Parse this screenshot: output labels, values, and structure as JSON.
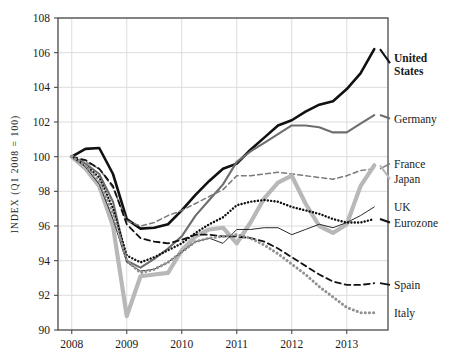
{
  "chart_data": {
    "type": "line",
    "title": "",
    "subtitle": "",
    "xlabel": "",
    "ylabel": "INDEX (Q1 2008 = 100)",
    "xlim": [
      2007.75,
      2013.75
    ],
    "ylim": [
      90,
      108
    ],
    "yticks": [
      90,
      92,
      94,
      96,
      98,
      100,
      102,
      104,
      106,
      108
    ],
    "xticks": [
      2008,
      2009,
      2010,
      2011,
      2012,
      2013
    ],
    "xtick_labels": [
      "2008",
      "2009",
      "2010",
      "2011",
      "2012",
      "2013"
    ],
    "ytick_labels": [
      "90",
      "92",
      "94",
      "96",
      "98",
      "100",
      "102",
      "104",
      "106",
      "108"
    ],
    "grid": true,
    "legend_position": "right-inline",
    "series": [
      {
        "name": "United States",
        "style": "solid",
        "color": "#111111",
        "width": 2.6,
        "bold_label": true,
        "label_y": 105.4,
        "x": [
          2008.0,
          2008.25,
          2008.5,
          2008.75,
          2009.0,
          2009.25,
          2009.5,
          2009.75,
          2010.0,
          2010.25,
          2010.5,
          2010.75,
          2011.0,
          2011.25,
          2011.5,
          2011.75,
          2012.0,
          2012.25,
          2012.5,
          2012.75,
          2013.0,
          2013.25,
          2013.5
        ],
        "values": [
          100.0,
          100.45,
          100.5,
          99.0,
          96.4,
          95.85,
          95.9,
          96.1,
          96.9,
          97.8,
          98.6,
          99.3,
          99.6,
          100.4,
          101.1,
          101.8,
          102.1,
          102.6,
          103.0,
          103.2,
          103.9,
          104.8,
          106.2
        ]
      },
      {
        "name": "Germany",
        "style": "solid",
        "color": "#6e6e6e",
        "width": 2.1,
        "bold_label": false,
        "label_y": 102.2,
        "x": [
          2008.0,
          2008.25,
          2008.5,
          2008.75,
          2009.0,
          2009.25,
          2009.5,
          2009.75,
          2010.0,
          2010.25,
          2010.5,
          2010.75,
          2011.0,
          2011.25,
          2011.5,
          2011.75,
          2012.0,
          2012.25,
          2012.5,
          2012.75,
          2013.0,
          2013.25,
          2013.5
        ],
        "values": [
          100.0,
          99.6,
          99.0,
          97.4,
          94.0,
          93.6,
          94.1,
          94.7,
          95.4,
          96.6,
          97.5,
          98.4,
          99.7,
          100.3,
          100.8,
          101.3,
          101.8,
          101.8,
          101.7,
          101.4,
          101.4,
          101.9,
          102.4
        ]
      },
      {
        "name": "France",
        "style": "dashed",
        "color": "#7a7a7a",
        "width": 1.5,
        "bold_label": false,
        "label_y": 99.6,
        "x": [
          2008.0,
          2008.25,
          2008.5,
          2008.75,
          2009.0,
          2009.25,
          2009.5,
          2009.75,
          2010.0,
          2010.25,
          2010.5,
          2010.75,
          2011.0,
          2011.25,
          2011.5,
          2011.75,
          2012.0,
          2012.25,
          2012.5,
          2012.75,
          2013.0,
          2013.25,
          2013.5
        ],
        "values": [
          100.0,
          99.7,
          99.3,
          98.2,
          96.3,
          96.0,
          96.2,
          96.6,
          96.9,
          97.3,
          97.7,
          98.1,
          98.9,
          98.9,
          99.0,
          99.1,
          99.0,
          98.9,
          98.8,
          98.7,
          98.9,
          99.2,
          99.3
        ]
      },
      {
        "name": "Japan",
        "style": "solid",
        "color": "#b8b8b8",
        "width": 4.2,
        "bold_label": false,
        "label_y": 98.7,
        "x": [
          2008.0,
          2008.25,
          2008.5,
          2008.75,
          2009.0,
          2009.25,
          2009.5,
          2009.75,
          2010.0,
          2010.25,
          2010.5,
          2010.75,
          2011.0,
          2011.25,
          2011.5,
          2011.75,
          2012.0,
          2012.25,
          2012.5,
          2012.75,
          2013.0,
          2013.25,
          2013.5
        ],
        "values": [
          100.0,
          99.3,
          98.3,
          96.0,
          90.8,
          93.1,
          93.2,
          93.3,
          94.6,
          95.4,
          95.8,
          95.9,
          95.0,
          96.2,
          97.6,
          98.5,
          98.9,
          97.3,
          96.0,
          95.6,
          96.1,
          98.3,
          99.5
        ]
      },
      {
        "name": "UK",
        "style": "solid",
        "color": "#2a2a2a",
        "width": 1.0,
        "bold_label": false,
        "label_y": 97.1,
        "x": [
          2008.0,
          2008.25,
          2008.5,
          2008.75,
          2009.0,
          2009.25,
          2009.5,
          2009.75,
          2010.0,
          2010.25,
          2010.5,
          2010.75,
          2011.0,
          2011.25,
          2011.5,
          2011.75,
          2012.0,
          2012.25,
          2012.5,
          2012.75,
          2013.0,
          2013.25,
          2013.5
        ],
        "values": [
          100.0,
          99.4,
          98.4,
          96.4,
          93.9,
          93.4,
          93.5,
          93.9,
          94.5,
          95.1,
          95.3,
          95.0,
          95.8,
          95.8,
          95.9,
          95.9,
          95.5,
          95.8,
          96.1,
          95.9,
          96.2,
          96.6,
          97.1
        ]
      },
      {
        "name": "Eurozone",
        "style": "dotted",
        "color": "#111111",
        "width": 2.4,
        "bold_label": false,
        "label_y": 96.2,
        "x": [
          2008.0,
          2008.25,
          2008.5,
          2008.75,
          2009.0,
          2009.25,
          2009.5,
          2009.75,
          2010.0,
          2010.25,
          2010.5,
          2010.75,
          2011.0,
          2011.25,
          2011.5,
          2011.75,
          2012.0,
          2012.25,
          2012.5,
          2012.75,
          2013.0,
          2013.25,
          2013.5
        ],
        "values": [
          100.0,
          99.5,
          98.8,
          97.0,
          94.3,
          93.9,
          94.2,
          94.6,
          95.0,
          95.6,
          96.1,
          96.5,
          97.2,
          97.4,
          97.5,
          97.4,
          97.1,
          96.9,
          96.7,
          96.4,
          96.2,
          96.2,
          96.4
        ]
      },
      {
        "name": "Spain",
        "style": "dashed",
        "color": "#111111",
        "width": 1.8,
        "bold_label": false,
        "label_y": 92.6,
        "x": [
          2008.0,
          2008.25,
          2008.5,
          2008.75,
          2009.0,
          2009.25,
          2009.5,
          2009.75,
          2010.0,
          2010.25,
          2010.5,
          2010.75,
          2011.0,
          2011.25,
          2011.5,
          2011.75,
          2012.0,
          2012.25,
          2012.5,
          2012.75,
          2013.0,
          2013.25,
          2013.5
        ],
        "values": [
          100.0,
          99.8,
          99.3,
          98.3,
          96.1,
          95.3,
          95.1,
          95.0,
          95.2,
          95.5,
          95.5,
          95.4,
          95.4,
          95.3,
          95.1,
          94.7,
          94.2,
          93.7,
          93.2,
          92.8,
          92.6,
          92.6,
          92.7
        ]
      },
      {
        "name": "Italy",
        "style": "dotted",
        "color": "#909090",
        "width": 3.0,
        "bold_label": false,
        "label_y": 91.0,
        "x": [
          2008.0,
          2008.25,
          2008.5,
          2008.75,
          2009.0,
          2009.25,
          2009.5,
          2009.75,
          2010.0,
          2010.25,
          2010.5,
          2010.75,
          2011.0,
          2011.25,
          2011.5,
          2011.75,
          2012.0,
          2012.25,
          2012.5,
          2012.75,
          2013.0,
          2013.25,
          2013.5
        ],
        "values": [
          100.0,
          99.5,
          98.6,
          96.7,
          94.0,
          93.3,
          93.5,
          93.9,
          94.5,
          95.1,
          95.3,
          95.4,
          95.5,
          95.3,
          94.9,
          94.4,
          93.8,
          93.2,
          92.5,
          91.9,
          91.3,
          91.0,
          91.0
        ]
      }
    ]
  },
  "legend": {
    "items": [
      {
        "label": "United States"
      },
      {
        "label": "Germany"
      },
      {
        "label": "France"
      },
      {
        "label": "Japan"
      },
      {
        "label": "UK"
      },
      {
        "label": "Eurozone"
      },
      {
        "label": "Spain"
      },
      {
        "label": "Italy"
      }
    ]
  },
  "axes": {
    "y_axis_title": "INDEX (Q1 2008 = 100)"
  },
  "colors": {
    "grid": "#dcdcdc",
    "frame": "#4a4a4a",
    "background": "#ffffff",
    "text": "#1a1a1a"
  }
}
